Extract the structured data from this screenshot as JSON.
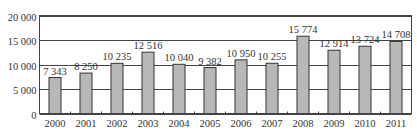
{
  "chart_data": {
    "type": "bar",
    "title": "",
    "xlabel": "",
    "ylabel": "",
    "categories": [
      "2000",
      "2001",
      "2002",
      "2003",
      "2004",
      "2005",
      "2006",
      "2007",
      "2008",
      "2009",
      "2010",
      "2011"
    ],
    "values": [
      7343,
      8250,
      10235,
      12516,
      10040,
      9382,
      10950,
      10255,
      15774,
      12914,
      13724,
      14708
    ],
    "value_labels": [
      "7 343",
      "8 250",
      "10 235",
      "12 516",
      "10 040",
      "9 382",
      "10 950",
      "10 255",
      "15 774",
      "12 914",
      "13 724",
      "14 708"
    ],
    "ylim": [
      0,
      20000
    ],
    "yticks": [
      0,
      5000,
      10000,
      15000,
      20000
    ],
    "ytick_labels": [
      "0",
      "5 000",
      "10 000",
      "15 000",
      "20 000"
    ],
    "grid": true,
    "legend": null,
    "colors": {
      "bar_fill": "#b8b8b8",
      "bar_stroke": "#333333",
      "grid": "#444444"
    }
  }
}
